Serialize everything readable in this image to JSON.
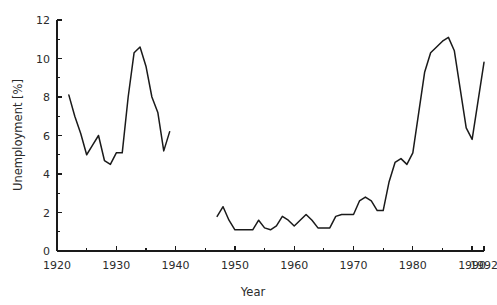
{
  "chart_data": {
    "type": "line",
    "title": "",
    "xlabel": "Year",
    "ylabel": "Unemployment [%]",
    "xlim": [
      1920,
      1992
    ],
    "ylim": [
      0,
      12
    ],
    "grid": false,
    "legend": "none",
    "x_ticks_major": [
      1920,
      1930,
      1940,
      1950,
      1960,
      1970,
      1980,
      1990,
      1992
    ],
    "x_tick_labels": [
      "1920",
      "1930",
      "1940",
      "1950",
      "1960",
      "1970",
      "1980",
      "1990",
      "1992"
    ],
    "x_ticks_minor": [
      1925,
      1935,
      1945,
      1955,
      1965,
      1975,
      1985
    ],
    "y_ticks_major": [
      0,
      2,
      4,
      6,
      8,
      10,
      12
    ],
    "y_tick_labels": [
      "0",
      "2",
      "4",
      "6",
      "8",
      "10",
      "12"
    ],
    "y_ticks_minor": [
      1,
      3,
      5,
      7,
      9,
      11
    ],
    "line_color": "#1a1a1a",
    "series": [
      {
        "name": "Unemployment pre-war",
        "x": [
          1922,
          1923,
          1924,
          1925,
          1926,
          1927,
          1928,
          1929,
          1930,
          1931,
          1932,
          1933,
          1934,
          1935,
          1936,
          1937,
          1938,
          1939
        ],
        "values": [
          8.1,
          7.0,
          6.1,
          5.0,
          5.5,
          6.0,
          4.7,
          4.5,
          5.1,
          5.1,
          8.0,
          10.3,
          10.6,
          9.6,
          8.0,
          7.2,
          5.2,
          6.2
        ]
      },
      {
        "name": "Unemployment post-war",
        "x": [
          1947,
          1948,
          1949,
          1950,
          1951,
          1952,
          1953,
          1954,
          1955,
          1956,
          1957,
          1958,
          1959,
          1960,
          1961,
          1962,
          1963,
          1964,
          1965,
          1966,
          1967,
          1968,
          1969,
          1970,
          1971,
          1972,
          1973,
          1974,
          1975,
          1976,
          1977,
          1978,
          1979,
          1980,
          1981,
          1982,
          1983,
          1984,
          1985,
          1986,
          1987,
          1988,
          1989,
          1990,
          1991,
          1992
        ],
        "values": [
          1.8,
          2.3,
          1.6,
          1.1,
          1.1,
          1.1,
          1.1,
          1.6,
          1.2,
          1.1,
          1.3,
          1.8,
          1.6,
          1.3,
          1.6,
          1.9,
          1.6,
          1.2,
          1.2,
          1.2,
          1.8,
          1.9,
          1.9,
          1.9,
          2.6,
          2.8,
          2.6,
          2.1,
          2.1,
          3.6,
          4.6,
          4.8,
          4.5,
          5.1,
          7.2,
          9.3,
          10.3,
          10.6,
          10.9,
          11.1,
          10.4,
          8.4,
          6.4,
          5.8,
          7.8,
          9.8
        ]
      }
    ]
  }
}
